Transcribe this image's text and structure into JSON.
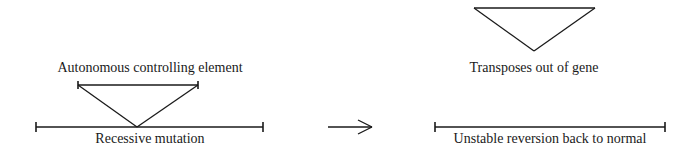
{
  "diagram": {
    "title": "",
    "colors": {
      "stroke": "#1a1a1a",
      "text": "#1a1a1a",
      "background": "#ffffff"
    },
    "left_panel": {
      "element_label": "Autonomous controlling element",
      "gene_label": "Recessive mutation"
    },
    "arrow": {
      "direction": "right"
    },
    "right_panel": {
      "element_label": "Transposes out of gene",
      "gene_label": "Unstable reversion back to normal"
    }
  }
}
